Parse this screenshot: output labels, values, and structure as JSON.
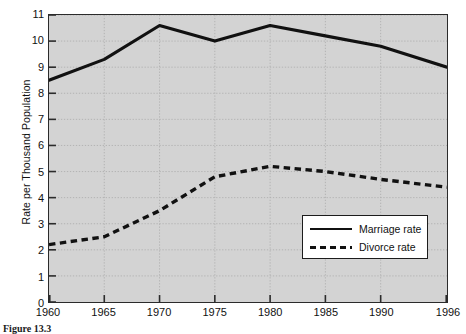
{
  "chart_data": {
    "type": "line",
    "title": "",
    "xlabel": "",
    "ylabel": "Rate per Thousand Population",
    "xlim": [
      1960,
      1996
    ],
    "ylim": [
      0,
      11
    ],
    "grid": true,
    "legend_position": "lower-right",
    "x_tick_labels": [
      "1960",
      "1965",
      "1970",
      "1975",
      "1980",
      "1985",
      "1990",
      "1996"
    ],
    "x_ticks": [
      1960,
      1965,
      1970,
      1975,
      1980,
      1985,
      1990,
      1996
    ],
    "y_tick_labels": [
      "0",
      "1",
      "2",
      "3",
      "4",
      "5",
      "6",
      "7",
      "8",
      "9",
      "10",
      "11"
    ],
    "y_ticks": [
      0,
      1,
      2,
      3,
      4,
      5,
      6,
      7,
      8,
      9,
      10,
      11
    ],
    "series": [
      {
        "name": "Marriage rate",
        "style": "solid",
        "color": "#111111",
        "x": [
          1960,
          1965,
          1970,
          1975,
          1980,
          1985,
          1990,
          1996
        ],
        "values": [
          8.5,
          9.3,
          10.6,
          10.0,
          10.6,
          10.2,
          9.8,
          9.0
        ]
      },
      {
        "name": "Divorce rate",
        "style": "dashed",
        "color": "#111111",
        "x": [
          1960,
          1965,
          1970,
          1975,
          1980,
          1985,
          1990,
          1996
        ],
        "values": [
          2.2,
          2.5,
          3.5,
          4.8,
          5.2,
          5.0,
          4.7,
          4.4
        ]
      }
    ]
  },
  "axes": {
    "y_title": "Rate per Thousand Population"
  },
  "legend": {
    "entries": [
      {
        "label": "Marriage rate",
        "style": "solid"
      },
      {
        "label": "Divorce rate",
        "style": "dashed"
      }
    ]
  },
  "caption": {
    "text": "Figure 13.3"
  },
  "colors": {
    "plot_background": "#d3d3d3",
    "axis_line": "#2b2b2b",
    "gridline": "#b0b0b0",
    "series_line": "#111111",
    "legend_background": "#ffffff",
    "page_background": "#ffffff"
  }
}
